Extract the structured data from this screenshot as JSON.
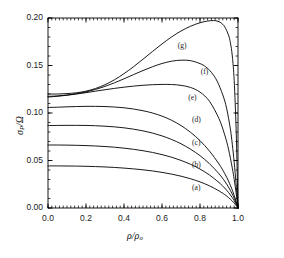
{
  "chart_data": {
    "type": "line",
    "title": "",
    "xlabel": "ρ/ρ₀",
    "ylabel": "σₚ/Ω",
    "xlabel_parts": {
      "num": "ρ",
      "den": "ρ",
      "den_sub": "o"
    },
    "ylabel_parts": {
      "num": "σ",
      "num_sub": "P",
      "den": "Ω"
    },
    "xlim": [
      0.0,
      1.0
    ],
    "ylim": [
      0.0,
      0.2
    ],
    "xticks": [
      0.0,
      0.2,
      0.4,
      0.6,
      0.8,
      1.0
    ],
    "xticklabels": [
      "0.0",
      "0.2",
      "0.4",
      "0.6",
      "0.8",
      "1.0"
    ],
    "yticks": [
      0.0,
      0.05,
      0.1,
      0.15,
      0.2
    ],
    "yticklabels": [
      "0.00",
      "0.05",
      "0.10",
      "0.15",
      "0.20"
    ],
    "xminor_step": 0.02,
    "yminor_step": 0.01,
    "grid": false,
    "legend": "inline-curve-labels",
    "line_color": "#000000",
    "line_width": 0.9,
    "frame_color": "#000000",
    "background": "#ffffff",
    "series": [
      {
        "name": "(a)",
        "label": "(a)",
        "label_x": 0.79,
        "label_y": 0.0215,
        "x": [
          0.0,
          0.05,
          0.1,
          0.15,
          0.2,
          0.25,
          0.3,
          0.35,
          0.4,
          0.45,
          0.5,
          0.55,
          0.6,
          0.65,
          0.7,
          0.75,
          0.8,
          0.85,
          0.9,
          0.93,
          0.95,
          0.97,
          0.98,
          0.99,
          0.995,
          1.0
        ],
        "y": [
          0.0443,
          0.0443,
          0.0442,
          0.0441,
          0.0439,
          0.0436,
          0.0432,
          0.0427,
          0.042,
          0.0412,
          0.0402,
          0.039,
          0.0375,
          0.0357,
          0.0335,
          0.0308,
          0.0275,
          0.0233,
          0.018,
          0.0141,
          0.011,
          0.0073,
          0.0051,
          0.0027,
          0.0014,
          0.0
        ]
      },
      {
        "name": "(b)",
        "label": "(b)",
        "label_x": 0.79,
        "label_y": 0.0455,
        "x": [
          0.0,
          0.05,
          0.1,
          0.15,
          0.2,
          0.25,
          0.3,
          0.35,
          0.4,
          0.45,
          0.5,
          0.55,
          0.6,
          0.65,
          0.7,
          0.75,
          0.8,
          0.85,
          0.9,
          0.93,
          0.95,
          0.97,
          0.98,
          0.99,
          0.995,
          1.0
        ],
        "y": [
          0.0663,
          0.0663,
          0.0662,
          0.066,
          0.0657,
          0.0653,
          0.0647,
          0.064,
          0.063,
          0.0618,
          0.0603,
          0.0585,
          0.0562,
          0.0535,
          0.0501,
          0.046,
          0.041,
          0.0347,
          0.0268,
          0.021,
          0.0164,
          0.0109,
          0.0077,
          0.004,
          0.0021,
          0.0
        ]
      },
      {
        "name": "(c)",
        "label": "(c)",
        "label_x": 0.79,
        "label_y": 0.0685,
        "x": [
          0.0,
          0.05,
          0.1,
          0.15,
          0.2,
          0.25,
          0.3,
          0.35,
          0.4,
          0.45,
          0.5,
          0.55,
          0.6,
          0.65,
          0.7,
          0.75,
          0.8,
          0.85,
          0.9,
          0.93,
          0.95,
          0.97,
          0.98,
          0.99,
          0.995,
          1.0
        ],
        "y": [
          0.0868,
          0.0869,
          0.087,
          0.087,
          0.0869,
          0.0866,
          0.0861,
          0.0854,
          0.0844,
          0.083,
          0.0812,
          0.0789,
          0.0759,
          0.0722,
          0.0676,
          0.0619,
          0.0551,
          0.0466,
          0.036,
          0.0282,
          0.022,
          0.0146,
          0.0103,
          0.0054,
          0.0028,
          0.0
        ]
      },
      {
        "name": "(d)",
        "label": "(d)",
        "label_x": 0.79,
        "label_y": 0.0925,
        "x": [
          0.0,
          0.05,
          0.1,
          0.15,
          0.2,
          0.25,
          0.3,
          0.35,
          0.4,
          0.45,
          0.5,
          0.55,
          0.6,
          0.65,
          0.7,
          0.75,
          0.8,
          0.85,
          0.9,
          0.93,
          0.95,
          0.97,
          0.98,
          0.99,
          0.995,
          1.0
        ],
        "y": [
          0.1058,
          0.1061,
          0.1065,
          0.1068,
          0.107,
          0.107,
          0.1068,
          0.1063,
          0.1055,
          0.1042,
          0.1024,
          0.1,
          0.0967,
          0.0924,
          0.0868,
          0.0797,
          0.0709,
          0.0599,
          0.0463,
          0.0363,
          0.0284,
          0.0188,
          0.0132,
          0.007,
          0.0036,
          0.0
        ]
      },
      {
        "name": "(e)",
        "label": "(e)",
        "label_x": 0.77,
        "label_y": 0.1155,
        "x": [
          0.0,
          0.05,
          0.1,
          0.15,
          0.2,
          0.25,
          0.3,
          0.35,
          0.4,
          0.45,
          0.5,
          0.55,
          0.6,
          0.65,
          0.7,
          0.75,
          0.8,
          0.85,
          0.9,
          0.93,
          0.95,
          0.97,
          0.98,
          0.99,
          0.995,
          1.0
        ],
        "y": [
          0.1168,
          0.1176,
          0.1187,
          0.12,
          0.1214,
          0.123,
          0.1245,
          0.1259,
          0.1272,
          0.1283,
          0.1292,
          0.1298,
          0.1301,
          0.13,
          0.1291,
          0.1269,
          0.122,
          0.1123,
          0.094,
          0.077,
          0.062,
          0.042,
          0.03,
          0.016,
          0.0082,
          0.0
        ]
      },
      {
        "name": "(f)",
        "label": "(f)",
        "label_x": 0.835,
        "label_y": 0.1428,
        "x": [
          0.0,
          0.05,
          0.1,
          0.15,
          0.2,
          0.25,
          0.3,
          0.35,
          0.4,
          0.45,
          0.5,
          0.55,
          0.6,
          0.65,
          0.7,
          0.75,
          0.8,
          0.83,
          0.86,
          0.89,
          0.92,
          0.94,
          0.96,
          0.97,
          0.98,
          0.99,
          0.995,
          1.0
        ],
        "y": [
          0.1175,
          0.118,
          0.1189,
          0.1203,
          0.1222,
          0.1248,
          0.128,
          0.1318,
          0.136,
          0.1404,
          0.1447,
          0.1487,
          0.1521,
          0.1545,
          0.1556,
          0.1551,
          0.152,
          0.1486,
          0.1428,
          0.1336,
          0.119,
          0.105,
          0.083,
          0.067,
          0.048,
          0.0255,
          0.013,
          0.0
        ]
      },
      {
        "name": "(g)",
        "label": "(g)",
        "label_x": 0.715,
        "label_y": 0.1705,
        "x": [
          0.0,
          0.05,
          0.1,
          0.15,
          0.2,
          0.25,
          0.3,
          0.35,
          0.4,
          0.45,
          0.5,
          0.55,
          0.6,
          0.65,
          0.7,
          0.75,
          0.8,
          0.84,
          0.87,
          0.89,
          0.91,
          0.93,
          0.95,
          0.96,
          0.97,
          0.98,
          0.99,
          0.995,
          1.0
        ],
        "y": [
          0.12,
          0.12,
          0.1204,
          0.1213,
          0.123,
          0.1258,
          0.1298,
          0.135,
          0.1414,
          0.1487,
          0.1566,
          0.1648,
          0.1727,
          0.18,
          0.1863,
          0.1913,
          0.195,
          0.1968,
          0.1973,
          0.1968,
          0.195,
          0.1908,
          0.182,
          0.174,
          0.16,
          0.134,
          0.084,
          0.045,
          0.0
        ]
      }
    ]
  },
  "axes": {
    "plot_left_px": 48,
    "plot_top_px": 18,
    "plot_width_px": 190,
    "plot_height_px": 190
  }
}
